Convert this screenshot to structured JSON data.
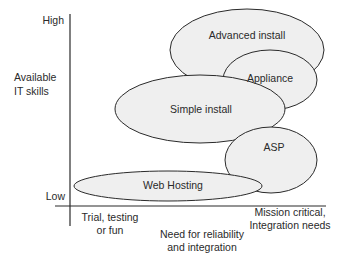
{
  "y_axis": {
    "title_line1": "Available",
    "title_line2": "IT skills",
    "high_label": "High",
    "low_label": "Low"
  },
  "x_axis": {
    "left_label_line1": "Trial, testing",
    "left_label_line2": "or fun",
    "center_label_line1": "Need for reliability",
    "center_label_line2": "and integration",
    "right_label_line1": "Mission critical,",
    "right_label_line2": "Integration needs"
  },
  "regions": [
    {
      "label": "Advanced install"
    },
    {
      "label": "Appliance"
    },
    {
      "label": "Simple install"
    },
    {
      "label": "ASP"
    },
    {
      "label": "Web Hosting"
    }
  ],
  "colors": {
    "ellipse_fill": "#efefef",
    "stroke": "#2a2a2a"
  }
}
